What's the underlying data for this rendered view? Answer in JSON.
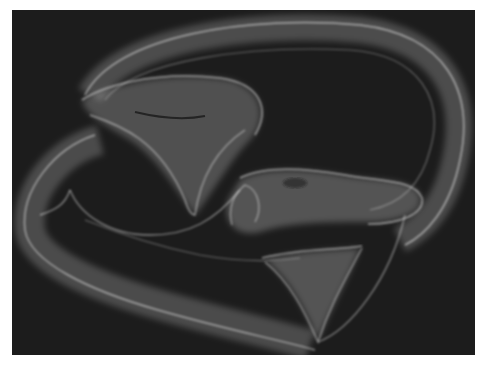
{
  "image": {
    "description": "Rendered translucent twisted tube surface on dark background",
    "background_color": "#1c1c1c",
    "border_color": "#ffffff",
    "surface_color": "#e6e6e6"
  }
}
